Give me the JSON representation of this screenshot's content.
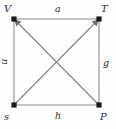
{
  "figure": {
    "background_color": "#fefefe",
    "vertex_color": "#1a1a1a",
    "square_edge_color": "#b0b0b0",
    "diagonal_edge_color": "#8a8a8a",
    "label_color": "#2b2b2b"
  },
  "vertices": [
    {
      "id": "V",
      "label": "V",
      "x": 14,
      "y": 19,
      "position": "top-left"
    },
    {
      "id": "T",
      "label": "T",
      "x": 99,
      "y": 19,
      "position": "top-right"
    },
    {
      "id": "s",
      "label": "s",
      "x": 14,
      "y": 105,
      "position": "bottom-left"
    },
    {
      "id": "P",
      "label": "P",
      "x": 99,
      "y": 105,
      "position": "bottom-right"
    }
  ],
  "edges": [
    {
      "id": "a",
      "label": "a",
      "from": "V",
      "to": "T",
      "kind": "side",
      "side": "top",
      "directed": false
    },
    {
      "id": "u",
      "label": "u",
      "from": "V",
      "to": "s",
      "kind": "side",
      "side": "left",
      "directed": false,
      "label_rotated": true
    },
    {
      "id": "g",
      "label": "g",
      "from": "T",
      "to": "P",
      "kind": "side",
      "side": "right",
      "directed": false
    },
    {
      "id": "h",
      "label": "h",
      "from": "s",
      "to": "P",
      "kind": "side",
      "side": "bottom",
      "directed": false
    },
    {
      "id": "sT",
      "label": "",
      "from": "s",
      "to": "T",
      "kind": "diagonal",
      "directed": true
    },
    {
      "id": "PV",
      "label": "",
      "from": "P",
      "to": "V",
      "kind": "diagonal",
      "directed": true
    }
  ]
}
